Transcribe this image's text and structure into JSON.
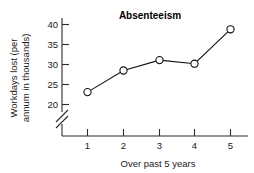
{
  "chart_data": {
    "type": "line",
    "title": "Absenteeism",
    "xlabel": "Over past 5 years",
    "ylabel": "Workdays lost (per annum in thousands)",
    "ylabel_line1": "Workdays lost (per",
    "ylabel_line2": "annum in thousands)",
    "x": [
      1,
      2,
      3,
      4,
      5
    ],
    "values": [
      23.1,
      28.5,
      31.1,
      30.2,
      38.8
    ],
    "categories": [
      "1",
      "2",
      "3",
      "4",
      "5"
    ],
    "xticklabels": [
      "1",
      "2",
      "3",
      "4",
      "5"
    ],
    "yticks": [
      20,
      25,
      30,
      35,
      40
    ],
    "yticklabels": [
      "20",
      "25",
      "30",
      "35",
      "40"
    ],
    "ylim": [
      20,
      41
    ],
    "xlim": [
      0.5,
      5.5
    ],
    "grid": false,
    "legend": false,
    "axis_break": true,
    "axis_break_axis": "y",
    "marker": "open-circle",
    "line_color": "#111111",
    "marker_fill": "#ffffff",
    "background_color": "#ffffff"
  },
  "labels": {
    "title": "Absenteeism",
    "xaxis_title": "Over past 5 years",
    "yaxis_title_line1": "Workdays lost (per",
    "yaxis_title_line2": "annum in thousands)",
    "y_20": "20",
    "y_25": "25",
    "y_30": "30",
    "y_35": "35",
    "y_40": "40",
    "x_1": "1",
    "x_2": "2",
    "x_3": "3",
    "x_4": "4",
    "x_5": "5"
  }
}
